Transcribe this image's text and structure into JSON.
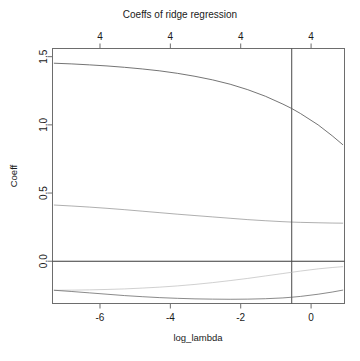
{
  "chart_data": {
    "type": "line",
    "title": "Coeffs of ridge regression",
    "xlabel": "log_lambda",
    "ylabel": "Coeff",
    "xlim": [
      -7.35,
      0.95
    ],
    "ylim": [
      -0.31,
      1.56
    ],
    "grid": false,
    "legend": "none",
    "x_ticks": [
      -6,
      -4,
      -2,
      0
    ],
    "x_tick_labels": [
      "-6",
      "-4",
      "-2",
      "0"
    ],
    "y_ticks": [
      0.0,
      0.5,
      1.0,
      1.5
    ],
    "y_tick_labels": [
      "0.0",
      "0.5",
      "1.0",
      "1.5"
    ],
    "top_axis_ticks": [
      -6,
      -4,
      -2,
      0
    ],
    "top_axis_tick_labels": [
      "4",
      "4",
      "4",
      "4"
    ],
    "top_axis_note": "number of nonzero coefficients",
    "vertical_reference_line": -0.55,
    "horizontal_reference_line": 0.0,
    "series": [
      {
        "name": "coef_1",
        "style": "solid-dark",
        "x": [
          -7.3,
          -6.8,
          -6.3,
          -5.8,
          -5.3,
          -4.8,
          -4.3,
          -3.8,
          -3.3,
          -2.8,
          -2.3,
          -1.8,
          -1.3,
          -0.8,
          -0.55,
          -0.3,
          0.2,
          0.6,
          0.9
        ],
        "y": [
          1.452,
          1.447,
          1.44,
          1.432,
          1.422,
          1.41,
          1.396,
          1.378,
          1.356,
          1.33,
          1.298,
          1.258,
          1.21,
          1.152,
          1.12,
          1.083,
          1.0,
          0.92,
          0.855
        ]
      },
      {
        "name": "coef_2",
        "style": "solid-light",
        "x": [
          -7.3,
          -6.8,
          -6.3,
          -5.8,
          -5.3,
          -4.8,
          -4.3,
          -3.8,
          -3.3,
          -2.8,
          -2.3,
          -1.8,
          -1.3,
          -0.8,
          -0.55,
          -0.3,
          0.2,
          0.6,
          0.9
        ],
        "y": [
          0.412,
          0.405,
          0.397,
          0.388,
          0.378,
          0.367,
          0.356,
          0.345,
          0.335,
          0.325,
          0.315,
          0.305,
          0.297,
          0.29,
          0.287,
          0.285,
          0.282,
          0.28,
          0.279
        ]
      },
      {
        "name": "coef_3",
        "style": "solid-faint",
        "x": [
          -7.3,
          -6.8,
          -6.3,
          -5.8,
          -5.3,
          -4.8,
          -4.3,
          -3.8,
          -3.3,
          -2.8,
          -2.3,
          -1.8,
          -1.3,
          -0.8,
          -0.55,
          -0.3,
          0.2,
          0.6,
          0.9
        ],
        "y": [
          -0.213,
          -0.212,
          -0.21,
          -0.207,
          -0.203,
          -0.197,
          -0.19,
          -0.181,
          -0.17,
          -0.157,
          -0.142,
          -0.126,
          -0.108,
          -0.09,
          -0.081,
          -0.072,
          -0.056,
          -0.046,
          -0.04
        ]
      },
      {
        "name": "coef_4",
        "style": "solid-dark2",
        "x": [
          -7.3,
          -6.8,
          -6.3,
          -5.8,
          -5.3,
          -4.8,
          -4.3,
          -3.8,
          -3.3,
          -2.8,
          -2.3,
          -1.8,
          -1.3,
          -0.8,
          -0.55,
          -0.3,
          0.2,
          0.6,
          0.9
        ],
        "y": [
          -0.213,
          -0.222,
          -0.232,
          -0.242,
          -0.252,
          -0.26,
          -0.267,
          -0.272,
          -0.276,
          -0.278,
          -0.279,
          -0.278,
          -0.275,
          -0.269,
          -0.264,
          -0.258,
          -0.242,
          -0.226,
          -0.212
        ]
      }
    ]
  }
}
